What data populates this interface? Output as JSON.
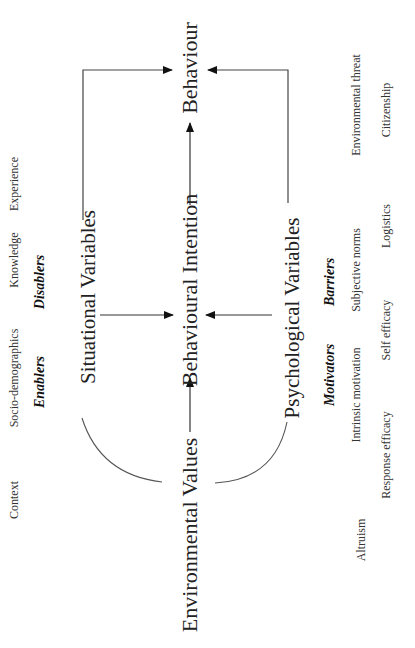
{
  "diagram": {
    "nodes": {
      "behaviour": "Behaviour",
      "behavioural_intention": "Behavioural Intention",
      "environmental_values": "Environmental Values",
      "situational_variables": "Situational Variables",
      "psychological_variables": "Psychological Variables"
    },
    "situational": {
      "groups": [
        "Enablers",
        "Disablers"
      ],
      "items": [
        "Context",
        "Socio-demographics",
        "Knowledge",
        "Experience"
      ]
    },
    "psychological": {
      "groups": [
        "Motivators",
        "Barriers"
      ],
      "items_row1": [
        "Intrinsic motivation",
        "Subjective norms",
        "Environmental threat"
      ],
      "items_row2": [
        "Altruism",
        "Response efficacy",
        "Self efficacy",
        "Logistics",
        "Citizenship"
      ]
    },
    "edges": [
      {
        "from": "Environmental Values",
        "to": "Behavioural Intention"
      },
      {
        "from": "Behavioural Intention",
        "to": "Behaviour"
      },
      {
        "from": "Situational Variables",
        "to": "Behavioural Intention"
      },
      {
        "from": "Psychological Variables",
        "to": "Behavioural Intention"
      },
      {
        "from": "Situational Variables",
        "to": "Behaviour"
      },
      {
        "from": "Psychological Variables",
        "to": "Behaviour"
      },
      {
        "from": "Environmental Values",
        "to": "Situational Variables"
      },
      {
        "from": "Environmental Values",
        "to": "Psychological Variables"
      }
    ]
  }
}
